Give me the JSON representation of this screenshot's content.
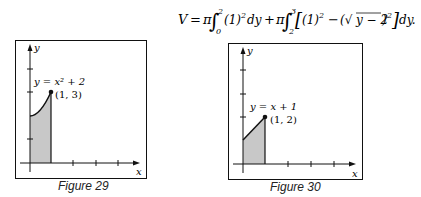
{
  "formula": {
    "text": "V = π∫₀² (1)² dy + π∫₂³ [(1)² − (√(y − 2))²] dy."
  },
  "figures": [
    {
      "caption": "Figure 29",
      "curve_label": "y = x² + 2",
      "point_label": "(1, 3)",
      "x_axis_label": "x",
      "y_axis_label": "y"
    },
    {
      "caption": "Figure 30",
      "curve_label": "y = x + 1",
      "point_label": "(1, 2)",
      "x_axis_label": "x",
      "y_axis_label": "y"
    }
  ],
  "colors": {
    "shade": "#c8c8c8",
    "ink": "#111111"
  }
}
